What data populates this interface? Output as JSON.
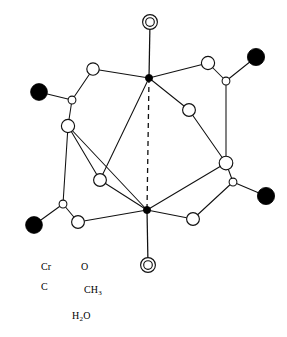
{
  "figure": {
    "background_color": "#ffffff",
    "line_color": "#111111"
  },
  "legend": {
    "entries": [
      {
        "key": "cr",
        "label": "Cr",
        "glyph": "small-filled-circle",
        "color": "#000000",
        "radius": 3.4,
        "x": 32,
        "y": 266
      },
      {
        "key": "o",
        "label": "O",
        "glyph": "large-open-circle",
        "color": "#ffffff",
        "radius": 6.4,
        "x": 70,
        "y": 266
      },
      {
        "key": "c",
        "label": "C",
        "glyph": "small-open-circle",
        "color": "#ffffff",
        "radius": 4.0,
        "x": 32,
        "y": 286
      },
      {
        "key": "ch3",
        "label": "CH",
        "label_sub": "3",
        "glyph": "large-filled-circle",
        "color": "#000000",
        "radius": 8.0,
        "x": 73,
        "y": 288
      },
      {
        "key": "h2o",
        "label": "H",
        "label_sub": "2",
        "label_tail": "O",
        "glyph": "double-open-circle",
        "color": "#ffffff",
        "radius": 7.4,
        "x": 59,
        "y": 315
      }
    ],
    "label_positions": {
      "cr": {
        "x": 41,
        "y": 262
      },
      "o": {
        "x": 81,
        "y": 262
      },
      "c": {
        "x": 41,
        "y": 282
      },
      "ch3": {
        "x": 84,
        "y": 285
      },
      "h2o": {
        "x": 72,
        "y": 311
      }
    }
  },
  "molecule": {
    "name": "chromium(II) acetate dihydrate",
    "metal_metal_bond": {
      "from": "cr-top",
      "to": "cr-bottom",
      "style": "dashed"
    },
    "atoms": [
      {
        "id": "h2o-top",
        "type": "H2O",
        "x": 150,
        "y": 22,
        "r": 7.4
      },
      {
        "id": "cr-top",
        "type": "Cr",
        "x": 149,
        "y": 78,
        "r": 3.6
      },
      {
        "id": "cr-bottom",
        "type": "Cr",
        "x": 147,
        "y": 210,
        "r": 3.6
      },
      {
        "id": "h2o-bottom",
        "type": "H2O",
        "x": 148,
        "y": 265,
        "r": 7.4
      },
      {
        "id": "o-ul-top",
        "type": "O",
        "x": 93,
        "y": 69,
        "r": 6.2
      },
      {
        "id": "c-ul",
        "type": "C",
        "x": 72,
        "y": 100,
        "r": 3.9
      },
      {
        "id": "ch3-ul",
        "type": "CH3",
        "x": 39,
        "y": 92,
        "r": 8.4
      },
      {
        "id": "o-ul-bot",
        "type": "O",
        "x": 68,
        "y": 126,
        "r": 6.6
      },
      {
        "id": "o-ur-top",
        "type": "O",
        "x": 208,
        "y": 63,
        "r": 6.6
      },
      {
        "id": "c-ur",
        "type": "C",
        "x": 226,
        "y": 81,
        "r": 3.9
      },
      {
        "id": "ch3-ur",
        "type": "CH3",
        "x": 256,
        "y": 57,
        "r": 8.6
      },
      {
        "id": "o-ur-bot",
        "type": "O",
        "x": 226,
        "y": 163,
        "r": 6.8
      },
      {
        "id": "o-inner-r",
        "type": "O",
        "x": 189,
        "y": 110,
        "r": 6.4
      },
      {
        "id": "o-inner-l",
        "type": "O",
        "x": 100,
        "y": 180,
        "r": 6.4
      },
      {
        "id": "o-ll-top",
        "type": "O",
        "x": 78,
        "y": 222,
        "r": 6.4
      },
      {
        "id": "c-ll",
        "type": "C",
        "x": 63,
        "y": 204,
        "r": 3.9
      },
      {
        "id": "ch3-ll",
        "type": "CH3",
        "x": 34,
        "y": 225,
        "r": 8.4
      },
      {
        "id": "o-lr-top",
        "type": "O",
        "x": 193,
        "y": 219,
        "r": 6.4
      },
      {
        "id": "c-lr",
        "type": "C",
        "x": 233,
        "y": 182,
        "r": 3.9
      },
      {
        "id": "ch3-lr",
        "type": "CH3",
        "x": 266,
        "y": 196,
        "r": 8.6
      }
    ],
    "bonds": [
      {
        "from": "h2o-top",
        "to": "cr-top",
        "style": "axial"
      },
      {
        "from": "h2o-bottom",
        "to": "cr-bottom",
        "style": "axial"
      },
      {
        "from": "cr-top",
        "to": "o-ul-top",
        "style": "solid"
      },
      {
        "from": "cr-top",
        "to": "o-ur-top",
        "style": "solid"
      },
      {
        "from": "cr-top",
        "to": "o-inner-r",
        "style": "solid"
      },
      {
        "from": "cr-top",
        "to": "o-inner-l",
        "style": "solid"
      },
      {
        "from": "cr-bottom",
        "to": "o-ll-top",
        "style": "solid"
      },
      {
        "from": "cr-bottom",
        "to": "o-lr-top",
        "style": "solid"
      },
      {
        "from": "cr-bottom",
        "to": "o-ul-bot",
        "style": "solid"
      },
      {
        "from": "cr-bottom",
        "to": "o-inner-l",
        "style": "solid"
      },
      {
        "from": "cr-bottom",
        "to": "o-ur-bot",
        "style": "solid"
      },
      {
        "from": "o-ul-top",
        "to": "c-ul",
        "style": "solid"
      },
      {
        "from": "c-ul",
        "to": "ch3-ul",
        "style": "solid"
      },
      {
        "from": "c-ul",
        "to": "o-ul-bot",
        "style": "solid"
      },
      {
        "from": "o-ur-top",
        "to": "c-ur",
        "style": "solid"
      },
      {
        "from": "c-ur",
        "to": "ch3-ur",
        "style": "solid"
      },
      {
        "from": "c-ur",
        "to": "o-ur-bot",
        "style": "solid"
      },
      {
        "from": "o-ll-top",
        "to": "c-ll",
        "style": "solid"
      },
      {
        "from": "c-ll",
        "to": "ch3-ll",
        "style": "solid"
      },
      {
        "from": "c-ll",
        "to": "o-ul-bot",
        "style": "solid"
      },
      {
        "from": "o-lr-top",
        "to": "c-lr",
        "style": "solid"
      },
      {
        "from": "c-lr",
        "to": "ch3-lr",
        "style": "solid"
      },
      {
        "from": "c-lr",
        "to": "o-ur-bot",
        "style": "solid"
      },
      {
        "from": "o-inner-r",
        "to": "o-ur-bot",
        "style": "solid"
      },
      {
        "from": "o-inner-l",
        "to": "o-ul-bot",
        "style": "solid"
      }
    ]
  }
}
